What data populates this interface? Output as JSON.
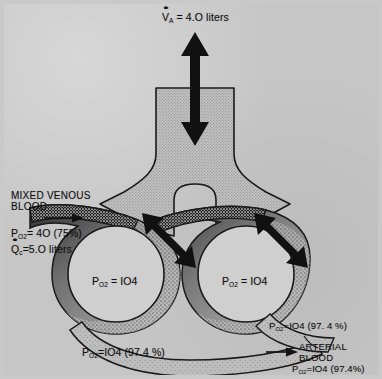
{
  "figure": {
    "background_color": "#c6c6c6",
    "ink_color": "#111111"
  },
  "labels": {
    "alveolar_ventilation": {
      "symbol": "V",
      "symbol_subscript": "A",
      "text": " = 4.O liters"
    },
    "mixed_venous_blood": {
      "line1": "MIXED VENOUS",
      "line2": "BLOOD"
    },
    "venous_po2": {
      "symbol": "P",
      "symbol_subscript": "O2",
      "text": "= 4O (75%)"
    },
    "capillary_flow": {
      "symbol": "Q",
      "symbol_subscript": "c",
      "text": "=5.O liters"
    },
    "alveolus_left": {
      "symbol": "P",
      "symbol_subscript": "O2",
      "text": " = IO4"
    },
    "alveolus_right": {
      "symbol": "P",
      "symbol_subscript": "O2",
      "text": " = IO4"
    },
    "pulmonary_vein_bottom": {
      "symbol": "P",
      "symbol_subscript": "O2",
      "text": "=IO4 (97.4 %)"
    },
    "pulmonary_vein_right": {
      "symbol": "P",
      "symbol_subscript": "O2",
      "text": "=IO4 (97. 4 %)"
    },
    "arterial_blood": {
      "line1": "ARTERIAL",
      "line2": "BLOOD"
    },
    "arterial_po2": {
      "symbol": "P",
      "symbol_subscript": "O2",
      "text": "=IO4 (97.4%)"
    }
  },
  "diagram_data": {
    "type": "anatomical-schematic",
    "alveolar_ventilation_liters": 4.0,
    "pulmonary_capillary_flow_liters": 5.0,
    "mixed_venous_po2_mmhg": 40,
    "mixed_venous_saturation_percent": 75,
    "alveolar_po2_mmhg": 104,
    "arterial_po2_mmhg": 104,
    "arterial_saturation_percent": 97.4,
    "structures": [
      "trachea",
      "bronchus-left",
      "bronchus-right",
      "alveolus-left",
      "alveolus-right",
      "pulmonary-artery",
      "pulmonary-capillary-left",
      "pulmonary-capillary-right",
      "pulmonary-vein"
    ],
    "arrows": [
      {
        "name": "ventilation-arrow",
        "direction": "bidirectional-vertical"
      },
      {
        "name": "diffusion-arrow-left",
        "direction": "bidirectional-diagonal"
      },
      {
        "name": "diffusion-arrow-right",
        "direction": "bidirectional-diagonal"
      },
      {
        "name": "mixed-venous-inflow-arrow",
        "direction": "right"
      },
      {
        "name": "arterial-outflow-arrow",
        "direction": "right"
      }
    ]
  }
}
